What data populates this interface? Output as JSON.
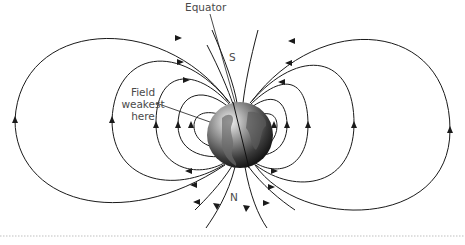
{
  "diagram": {
    "labels": {
      "equator": "Equator",
      "south": "S",
      "north": "N",
      "weak_line1": "Field",
      "weak_line2": "weakest",
      "weak_line3": "here"
    },
    "colors": {
      "line": "#1a1a1a",
      "text": "#4a4a4a",
      "globe_light": "#d9d9d9",
      "globe_dark": "#1a1a1a",
      "divider": "#bfbfbf"
    }
  }
}
